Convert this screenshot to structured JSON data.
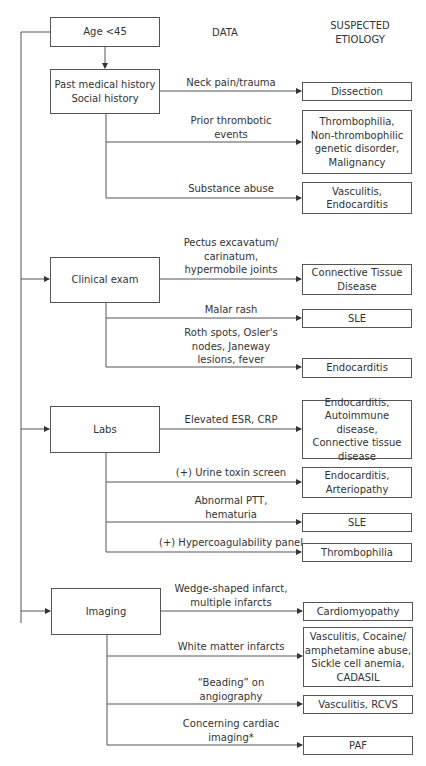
{
  "headers": {
    "data": "DATA",
    "etiology": "SUSPECTED\nETIOLOGY"
  },
  "root": {
    "label": "Age <45"
  },
  "sections": [
    {
      "label": "Past medical history\nSocial history",
      "branches": [
        {
          "data": "Neck pain/trauma",
          "etiology": "Dissection"
        },
        {
          "data": "Prior thrombotic\nevents",
          "etiology": "Thrombophilia,\nNon-thrombophilic\ngenetic disorder,\nMalignancy"
        },
        {
          "data": "Substance abuse",
          "etiology": "Vasculitis,\nEndocarditis"
        }
      ]
    },
    {
      "label": "Clinical exam",
      "branches": [
        {
          "data": "Pectus excavatum/\ncarinatum,\nhypermobile joints",
          "etiology": "Connective Tissue\nDisease"
        },
        {
          "data": "Malar rash",
          "etiology": "SLE"
        },
        {
          "data": "Roth spots, Osler's\nnodes, Janeway\nlesions, fever",
          "etiology": "Endocarditis"
        }
      ]
    },
    {
      "label": "Labs",
      "branches": [
        {
          "data": "Elevated ESR, CRP",
          "etiology": "Endocarditis,\nAutoimmune disease,\nConnective tissue\ndisease"
        },
        {
          "data": "(+) Urine toxin screen",
          "etiology": "Endocarditis,\nArteriopathy"
        },
        {
          "data": "Abnormal PTT,\nhematuria",
          "etiology": "SLE"
        },
        {
          "data": "(+) Hypercoagulability panel",
          "etiology": "Thrombophilia"
        }
      ]
    },
    {
      "label": "Imaging",
      "branches": [
        {
          "data": "Wedge-shaped infarct,\nmultiple infarcts",
          "etiology": "Cardiomyopathy"
        },
        {
          "data": "White matter infarcts",
          "etiology": "Vasculitis, Cocaine/\namphetamine abuse,\nSickle cell anemia,\nCADASIL"
        },
        {
          "data": "“Beading” on\nangiography",
          "etiology": "Vasculitis, RCVS"
        },
        {
          "data": "Concerning cardiac\nimaging*",
          "etiology": "PAF"
        }
      ]
    }
  ],
  "colors": {
    "line": "#555555",
    "text": "#333333",
    "background": "#ffffff"
  }
}
